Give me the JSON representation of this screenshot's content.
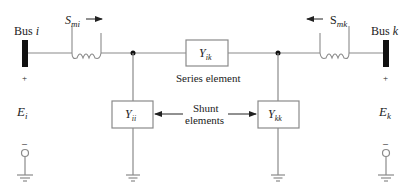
{
  "bus_i": {
    "label": "Bus ",
    "label_italic": "i",
    "sign_plus": "+",
    "sign_minus": "–",
    "voltage": "E",
    "voltage_sub": "i"
  },
  "bus_k": {
    "label": "Bus ",
    "label_italic": "k",
    "sign_plus": "+",
    "sign_minus": "–",
    "voltage": "E",
    "voltage_sub": "k"
  },
  "flow_i": {
    "symbol": "S",
    "sub": "mi",
    "direction": "right"
  },
  "flow_k": {
    "symbol": "S",
    "sub": "mk",
    "direction": "left"
  },
  "series": {
    "symbol": "Y",
    "sub": "ik",
    "caption": "Series element"
  },
  "shunt_i": {
    "symbol": "Y",
    "sub": "ii"
  },
  "shunt_k": {
    "symbol": "Y",
    "sub": "kk"
  },
  "shunt_caption": {
    "line1": "Shunt",
    "line2": "elements"
  },
  "colors": {
    "line": "#8a8a8a",
    "bus": "#111111",
    "text": "#222222"
  }
}
